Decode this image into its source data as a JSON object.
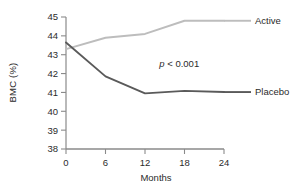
{
  "chart_data": {
    "type": "line",
    "title": "",
    "xlabel": "Months",
    "ylabel": "BMC (%)",
    "x": [
      0,
      6,
      12,
      18,
      24
    ],
    "xticklabels": [
      "0",
      "6",
      "12",
      "18",
      "24"
    ],
    "xlim": [
      0,
      24
    ],
    "ylim": [
      38,
      45
    ],
    "yticks": [
      38,
      39,
      40,
      41,
      42,
      43,
      44,
      45
    ],
    "yticklabels": [
      "38",
      "39",
      "40",
      "41",
      "42",
      "43",
      "44",
      "45"
    ],
    "grid": false,
    "legend_position": "right-inline-labels",
    "series": [
      {
        "name": "Active",
        "values": [
          43.3,
          43.9,
          44.1,
          44.8,
          44.8
        ],
        "color": "#bdbdbd",
        "label": "Active"
      },
      {
        "name": "Placebo",
        "values": [
          43.65,
          41.85,
          40.95,
          41.08,
          41.02
        ],
        "color": "#5a5a5a",
        "label": "Placebo"
      }
    ],
    "annotations": [
      {
        "name": "p-value",
        "text_italic": "p",
        "text_rest": " < 0.001",
        "full_text": "p < 0.001",
        "x": 17.2,
        "y": 42.35
      }
    ]
  },
  "axis": {
    "line_color": "#8a8a8a",
    "tick_color": "#8a8a8a",
    "text_color": "#2b2b2b"
  }
}
